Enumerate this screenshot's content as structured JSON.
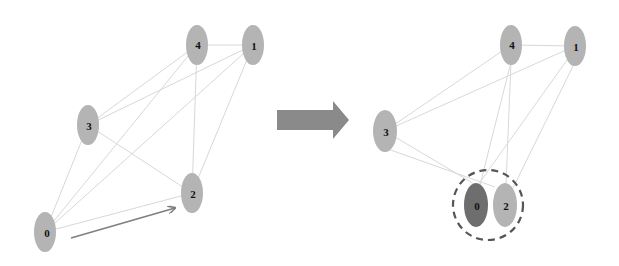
{
  "diagram": {
    "colors": {
      "node_fill": "#b4b4b4",
      "merged_node_fill": "#6e6e6e",
      "edge": "#d8d8d8",
      "arrow": "#808080",
      "dashed_group": "#555555"
    },
    "before": {
      "nodes": [
        {
          "id": "0",
          "label": "0",
          "x": 45,
          "y": 232
        },
        {
          "id": "1",
          "label": "1",
          "x": 253,
          "y": 45
        },
        {
          "id": "2",
          "label": "2",
          "x": 192,
          "y": 193
        },
        {
          "id": "3",
          "label": "3",
          "x": 88,
          "y": 125
        },
        {
          "id": "4",
          "label": "4",
          "x": 197,
          "y": 45
        }
      ],
      "edges": [
        [
          "0",
          "3"
        ],
        [
          "0",
          "4"
        ],
        [
          "0",
          "1"
        ],
        [
          "0",
          "2"
        ],
        [
          "3",
          "4"
        ],
        [
          "3",
          "1"
        ],
        [
          "3",
          "2"
        ],
        [
          "4",
          "1"
        ],
        [
          "4",
          "2"
        ],
        [
          "1",
          "2"
        ]
      ],
      "move_arrow": {
        "from": "0",
        "to": "2"
      }
    },
    "transition_arrow": "right-arrow",
    "after": {
      "nodes": [
        {
          "id": "0",
          "label": "0",
          "x": 476,
          "y": 205,
          "highlighted": true
        },
        {
          "id": "1",
          "label": "1",
          "x": 575,
          "y": 46
        },
        {
          "id": "2",
          "label": "2",
          "x": 505,
          "y": 205
        },
        {
          "id": "3",
          "label": "3",
          "x": 385,
          "y": 131
        },
        {
          "id": "4",
          "label": "4",
          "x": 511,
          "y": 45
        }
      ],
      "edges": [
        [
          "3",
          "4"
        ],
        [
          "3",
          "1"
        ],
        [
          "3",
          "0"
        ],
        [
          "3",
          "2"
        ],
        [
          "4",
          "1"
        ],
        [
          "4",
          "0"
        ],
        [
          "4",
          "2"
        ],
        [
          "1",
          "0"
        ],
        [
          "1",
          "2"
        ]
      ],
      "group": {
        "members": [
          "0",
          "2"
        ],
        "style": "dashed-circle"
      }
    }
  }
}
